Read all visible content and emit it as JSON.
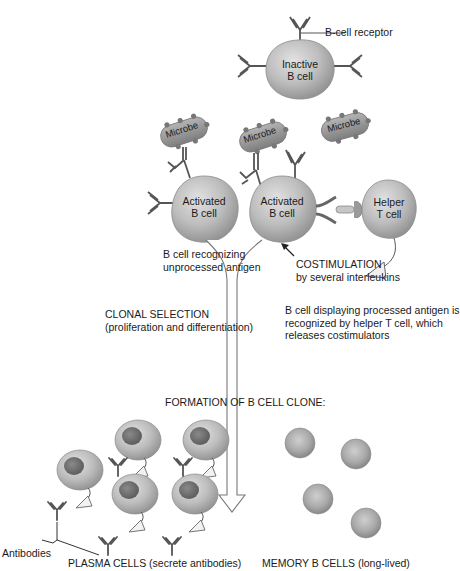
{
  "diagram": {
    "top": {
      "receptor_label": "B-cell receptor",
      "inactive_cell": {
        "line1": "Inactive",
        "line2": "B cell"
      }
    },
    "microbes": [
      "Microbe",
      "Microbe",
      "Microbe"
    ],
    "activated_cells": [
      {
        "line1": "Activated",
        "line2": "B cell"
      },
      {
        "line1": "Activated",
        "line2": "B cell"
      }
    ],
    "helper_cell": {
      "line1": "Helper",
      "line2": "T cell"
    },
    "annotations": {
      "recognizing": {
        "line1": "B cell recognizing",
        "line2": "unprocessed antigen"
      },
      "costimulation": {
        "line1": "COSTIMULATION",
        "line2": "by several interleukins"
      },
      "clonal_selection": {
        "line1": "CLONAL SELECTION",
        "line2": "(proliferation and differentiation)"
      },
      "processed_antigen": {
        "line1": "B cell displaying processed antigen is",
        "line2": "recognized by helper T cell, which",
        "line3": "releases costimulators"
      },
      "formation": "FORMATION OF B CELL CLONE:",
      "antibodies": "Antibodies",
      "plasma_cells": "PLASMA CELLS (secrete antibodies)",
      "memory_cells": "MEMORY B CELLS (long-lived)"
    },
    "colors": {
      "cell_fill": "#b5b5b5",
      "cell_shadow": "#8c8c8c",
      "microbe_fill": "#9a9a9a",
      "nucleus": "#6a6a6a",
      "line": "#555555",
      "text": "#1a1a1a"
    }
  }
}
